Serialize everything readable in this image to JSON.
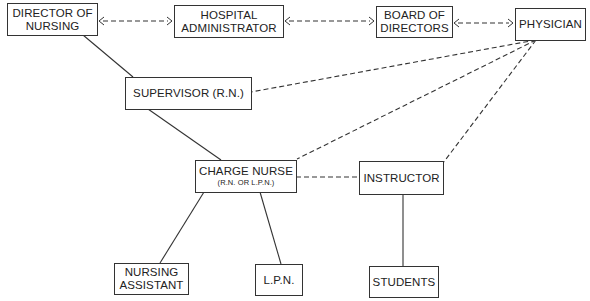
{
  "nodes": {
    "director": {
      "line1": "DIRECTOR OF",
      "line2": "NURSING"
    },
    "administrator": {
      "line1": "HOSPITAL",
      "line2": "ADMINISTRATOR"
    },
    "board": {
      "line1": "BOARD OF",
      "line2": "DIRECTORS"
    },
    "physician": {
      "label": "PHYSICIAN"
    },
    "supervisor": {
      "label": "SUPERVISOR (R.N.)"
    },
    "charge_nurse": {
      "label": "CHARGE NURSE",
      "sub": "(R.N. OR L.P.N.)"
    },
    "instructor": {
      "label": "INSTRUCTOR"
    },
    "nursing_assistant": {
      "line1": "NURSING",
      "line2": "ASSISTANT"
    },
    "lpn": {
      "label": "L.P.N."
    },
    "students": {
      "label": "STUDENTS"
    }
  },
  "edges": [
    {
      "from": "director",
      "to": "administrator",
      "style": "dashed",
      "arrows": "both"
    },
    {
      "from": "administrator",
      "to": "board",
      "style": "dashed",
      "arrows": "both"
    },
    {
      "from": "board",
      "to": "physician",
      "style": "dashed",
      "arrows": "both"
    },
    {
      "from": "director",
      "to": "supervisor",
      "style": "solid"
    },
    {
      "from": "supervisor",
      "to": "charge_nurse",
      "style": "solid"
    },
    {
      "from": "physician",
      "to": "supervisor",
      "style": "dashed"
    },
    {
      "from": "physician",
      "to": "charge_nurse",
      "style": "dashed"
    },
    {
      "from": "physician",
      "to": "instructor",
      "style": "dashed"
    },
    {
      "from": "charge_nurse",
      "to": "instructor",
      "style": "dashed"
    },
    {
      "from": "charge_nurse",
      "to": "nursing_assistant",
      "style": "solid"
    },
    {
      "from": "charge_nurse",
      "to": "lpn",
      "style": "solid"
    },
    {
      "from": "instructor",
      "to": "students",
      "style": "solid"
    }
  ]
}
